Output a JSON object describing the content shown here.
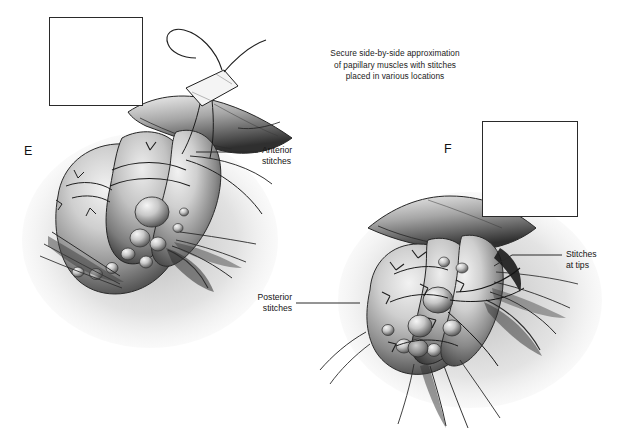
{
  "figure": {
    "background_color": "#ffffff",
    "style": "grayscale medical line-and-tone illustration",
    "width": 638,
    "height": 433
  },
  "caption": {
    "line1": "Secure side-by-side approximation",
    "line2": "of papillary muscles with stitches",
    "line3": "placed in various locations"
  },
  "panels": [
    {
      "letter": "E",
      "name": "panel-e",
      "description": "Anterior view of approximated papillary muscles with encircling stitches and a pledgeted suture held above",
      "inset_description": "Schematic of two papillary muscle heads sewn side by side with multiple stitches"
    },
    {
      "letter": "F",
      "name": "panel-f",
      "description": "Alternate view of approximated papillary muscles showing posterior stitches and stitches at the muscle tips",
      "inset_description": "Schematic of two papillary muscle heads sewn side by side with stitches at tips"
    }
  ],
  "callouts": [
    {
      "id": "anterior",
      "line1": "Anterior",
      "line2": "stitches"
    },
    {
      "id": "posterior",
      "line1": "Posterior",
      "line2": "stitches"
    },
    {
      "id": "tips",
      "line1": "Stitches",
      "line2": "at tips"
    }
  ],
  "colors": {
    "background": "#ffffff",
    "ink": "#1a1a1a",
    "leader_line": "#2b2b2b",
    "tissue_light": "#e9e9e9",
    "tissue_mid": "#9a9a9a",
    "tissue_dark": "#3a3a3a",
    "shadow": "#111111",
    "inset_border": "#2a2a2a",
    "inset_fill": "#b9b9b9"
  }
}
